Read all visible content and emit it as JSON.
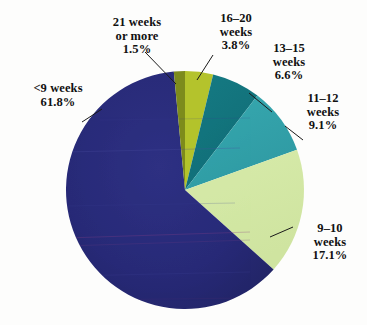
{
  "chart_data": {
    "type": "pie",
    "title": "",
    "subtitle": "",
    "xlabel": "",
    "ylabel": "",
    "legend_position": "none",
    "grid": false,
    "unit": "%",
    "categories": [
      "<9 weeks",
      "9-10 weeks",
      "11-12 weeks",
      "13-15 weeks",
      "16-20 weeks",
      "21 weeks or more"
    ],
    "values": [
      61.8,
      17.1,
      9.1,
      6.6,
      3.8,
      1.5
    ],
    "colors": [
      "#282a78",
      "#d4e8a6",
      "#35a5ad",
      "#14767f",
      "#b4c32c",
      "#7d8b1c"
    ],
    "slices": [
      {
        "label_line1": "<9 weeks",
        "label_line2": "61.8%",
        "label_line3": "",
        "value": 61.8,
        "color": "#282a78"
      },
      {
        "label_line1": "9–10",
        "label_line2": "weeks",
        "label_line3": "17.1%",
        "value": 17.1,
        "color": "#d4e8a6"
      },
      {
        "label_line1": "11–12",
        "label_line2": "weeks",
        "label_line3": "9.1%",
        "value": 9.1,
        "color": "#35a5ad"
      },
      {
        "label_line1": "13–15",
        "label_line2": "weeks",
        "label_line3": "6.6%",
        "value": 6.6,
        "color": "#14767f"
      },
      {
        "label_line1": "16–20",
        "label_line2": "weeks",
        "label_line3": "3.8%",
        "value": 3.8,
        "color": "#b4c32c"
      },
      {
        "label_line1": "21 weeks",
        "label_line2": "or more",
        "label_line3": "1.5%",
        "value": 1.5,
        "color": "#7d8b1c"
      }
    ]
  },
  "labels": {
    "lt9": {
      "line1": "<9 weeks",
      "line2": "61.8%"
    },
    "w910": {
      "line1": "9–10",
      "line2": "weeks",
      "line3": "17.1%"
    },
    "w1112": {
      "line1": "11–12",
      "line2": "weeks",
      "line3": "9.1%"
    },
    "w1315": {
      "line1": "13–15",
      "line2": "weeks",
      "line3": "6.6%"
    },
    "w1620": {
      "line1": "16–20",
      "line2": "weeks",
      "line3": "3.8%"
    },
    "w21": {
      "line1": "21 weeks",
      "line2": "or more",
      "line3": "1.5%"
    }
  },
  "colors": {
    "slice_lt9": "#282a78",
    "slice_910": "#d4e8a6",
    "slice_1112": "#35a5ad",
    "slice_1315": "#14767f",
    "slice_1620": "#b4c32c",
    "slice_21": "#7d8b1c",
    "background": "#fdfdfc",
    "leader_line": "#1a1a1a",
    "text": "#111111"
  }
}
